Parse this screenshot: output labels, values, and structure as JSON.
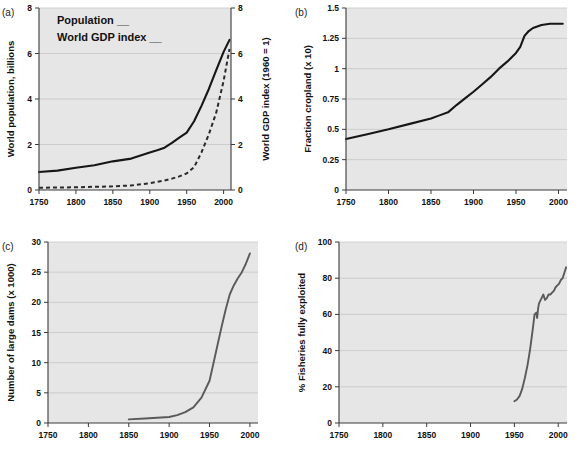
{
  "figure": {
    "panel_labels": {
      "a": "(a)",
      "b": "(b)",
      "c": "(c)",
      "d": "(d)"
    }
  },
  "chart_data": [
    {
      "id": "a",
      "type": "line",
      "panel_label": "(a)",
      "title": "",
      "xlabel": "",
      "ylabel": "World population, billions",
      "y2label": "World GDP index (1960 = 1)",
      "xlim": [
        1750,
        2010
      ],
      "ylim": [
        0,
        8
      ],
      "y2lim": [
        0,
        8
      ],
      "xticks": [
        1750,
        1800,
        1850,
        1900,
        1950,
        2000
      ],
      "xticklabels": [
        "1750",
        "1800",
        "1850",
        "1900",
        "1950",
        "2000"
      ],
      "yticks": [
        0,
        2,
        4,
        6,
        8
      ],
      "yticklabels": [
        "0",
        "2",
        "4",
        "6",
        "8"
      ],
      "y2ticks": [
        0,
        2,
        4,
        6,
        8
      ],
      "y2ticklabels": [
        "0",
        "2",
        "4",
        "6",
        "8"
      ],
      "grid": true,
      "legend_position": "top-left",
      "legend": [
        {
          "name": "Population",
          "label": "Population __",
          "style": "solid",
          "color": "#161616"
        },
        {
          "name": "World GDP index",
          "label": "World GDP index __",
          "style": "dashed",
          "color": "#2a2a2a"
        }
      ],
      "series": [
        {
          "name": "Population",
          "style": "solid",
          "axis": "left",
          "x": [
            1750,
            1775,
            1800,
            1825,
            1850,
            1875,
            1900,
            1910,
            1920,
            1930,
            1940,
            1950,
            1960,
            1970,
            1980,
            1990,
            2000,
            2008
          ],
          "values": [
            0.79,
            0.85,
            0.98,
            1.09,
            1.26,
            1.38,
            1.65,
            1.75,
            1.86,
            2.07,
            2.3,
            2.52,
            3.02,
            3.7,
            4.44,
            5.27,
            6.07,
            6.6
          ]
        },
        {
          "name": "World GDP index",
          "style": "dashed",
          "axis": "right",
          "x": [
            1750,
            1800,
            1850,
            1875,
            1900,
            1920,
            1930,
            1940,
            1950,
            1960,
            1970,
            1980,
            1990,
            2000,
            2008
          ],
          "values": [
            0.1,
            0.12,
            0.16,
            0.2,
            0.3,
            0.42,
            0.5,
            0.6,
            0.73,
            1.0,
            1.65,
            2.45,
            3.4,
            4.8,
            6.2
          ]
        }
      ]
    },
    {
      "id": "b",
      "type": "line",
      "panel_label": "(b)",
      "title": "",
      "xlabel": "",
      "ylabel": "Fraction cropland (x 10)",
      "xlim": [
        1750,
        2010
      ],
      "ylim": [
        0,
        1.5
      ],
      "xticks": [
        1750,
        1800,
        1850,
        1900,
        1950,
        2000
      ],
      "xticklabels": [
        "1750",
        "1800",
        "1850",
        "1900",
        "1950",
        "2000"
      ],
      "yticks": [
        0,
        0.25,
        0.5,
        0.75,
        1,
        1.25,
        1.5
      ],
      "yticklabels": [
        "0",
        "0.25",
        "0.5",
        "0.75",
        "1",
        "1.25",
        "1.5"
      ],
      "grid": true,
      "series": [
        {
          "name": "Fraction cropland",
          "style": "solid",
          "axis": "left",
          "x": [
            1750,
            1775,
            1800,
            1825,
            1850,
            1860,
            1870,
            1880,
            1890,
            1900,
            1910,
            1920,
            1930,
            1940,
            1950,
            1955,
            1960,
            1965,
            1970,
            1980,
            1990,
            2000,
            2005
          ],
          "values": [
            0.42,
            0.46,
            0.5,
            0.545,
            0.59,
            0.615,
            0.64,
            0.7,
            0.755,
            0.81,
            0.87,
            0.93,
            1.0,
            1.06,
            1.13,
            1.18,
            1.27,
            1.31,
            1.335,
            1.36,
            1.37,
            1.37,
            1.37
          ]
        }
      ]
    },
    {
      "id": "c",
      "type": "line",
      "panel_label": "(c)",
      "title": "",
      "xlabel": "",
      "ylabel": "Number of large dams (x 1000)",
      "xlim": [
        1750,
        2010
      ],
      "ylim": [
        0,
        30
      ],
      "xticks": [
        1750,
        1800,
        1850,
        1900,
        1950,
        2000
      ],
      "xticklabels": [
        "1750",
        "1800",
        "1850",
        "1900",
        "1950",
        "2000"
      ],
      "yticks": [
        0,
        5,
        10,
        15,
        20,
        25,
        30
      ],
      "yticklabels": [
        "0",
        "5",
        "10",
        "15",
        "20",
        "25",
        "30"
      ],
      "grid": true,
      "series": [
        {
          "name": "Number of large dams",
          "style": "gray",
          "axis": "left",
          "x": [
            1850,
            1870,
            1890,
            1900,
            1910,
            1920,
            1930,
            1940,
            1950,
            1955,
            1960,
            1965,
            1970,
            1975,
            1980,
            1985,
            1990,
            1995,
            2000
          ],
          "values": [
            0.6,
            0.75,
            0.9,
            1.0,
            1.3,
            1.8,
            2.6,
            4.2,
            7.0,
            10.0,
            13.0,
            16.0,
            18.8,
            21.3,
            22.8,
            24.0,
            25.0,
            26.4,
            28.1
          ]
        }
      ]
    },
    {
      "id": "d",
      "type": "line",
      "panel_label": "(d)",
      "title": "",
      "xlabel": "",
      "ylabel": "% Fisheries fully exploited",
      "xlim": [
        1750,
        2010
      ],
      "ylim": [
        0,
        100
      ],
      "xticks": [
        1750,
        1800,
        1850,
        1900,
        1950,
        2000
      ],
      "xticklabels": [
        "1750",
        "1800",
        "1850",
        "1900",
        "1950",
        "2000"
      ],
      "yticks": [
        0,
        20,
        40,
        60,
        80,
        100
      ],
      "yticklabels": [
        "0",
        "20",
        "40",
        "60",
        "80",
        "100"
      ],
      "grid": true,
      "series": [
        {
          "name": "% Fisheries fully exploited",
          "style": "gray",
          "axis": "left",
          "x": [
            1950,
            1953,
            1956,
            1959,
            1962,
            1965,
            1968,
            1971,
            1973,
            1975,
            1976,
            1977,
            1978,
            1980,
            1982,
            1983,
            1985,
            1987,
            1989,
            1991,
            1993,
            1995,
            1997,
            1999,
            2001,
            2003,
            2005,
            2007,
            2009
          ],
          "values": [
            12,
            13,
            15,
            19,
            25,
            32,
            41,
            52,
            60,
            61,
            58,
            63,
            66,
            68,
            70,
            71,
            68,
            69,
            71,
            71,
            72,
            73,
            75,
            76,
            77,
            79,
            80,
            83,
            86
          ]
        }
      ]
    }
  ]
}
